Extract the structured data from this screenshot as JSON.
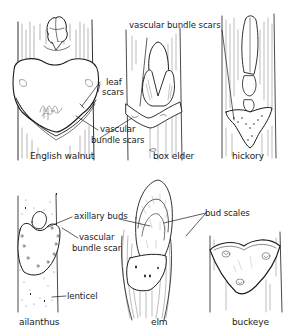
{
  "diagram": {
    "type": "botanical-illustration",
    "line_color": "#1a1a1a",
    "background": "#ffffff"
  },
  "panels": [
    {
      "id": "english-walnut",
      "caption": "English walnut",
      "annotations": [
        {
          "text_line1": "leaf",
          "text_line2": "scars"
        },
        {
          "text_line1": "vascular",
          "text_line2": "bundle scars"
        }
      ]
    },
    {
      "id": "box-elder",
      "caption": "box elder",
      "annotations": [
        {
          "text": "vascular bundle scars"
        }
      ]
    },
    {
      "id": "hickory",
      "caption": "hickory",
      "annotations": []
    },
    {
      "id": "ailanthus",
      "caption": "ailanthus",
      "annotations": [
        {
          "text": "axillary buds"
        },
        {
          "text_line1": "vascular",
          "text_line2": "bundle scar"
        },
        {
          "text": "lenticel"
        }
      ]
    },
    {
      "id": "elm",
      "caption": "elm",
      "annotations": [
        {
          "text": "bud scales"
        }
      ]
    },
    {
      "id": "buckeye",
      "caption": "buckeye",
      "annotations": []
    }
  ]
}
